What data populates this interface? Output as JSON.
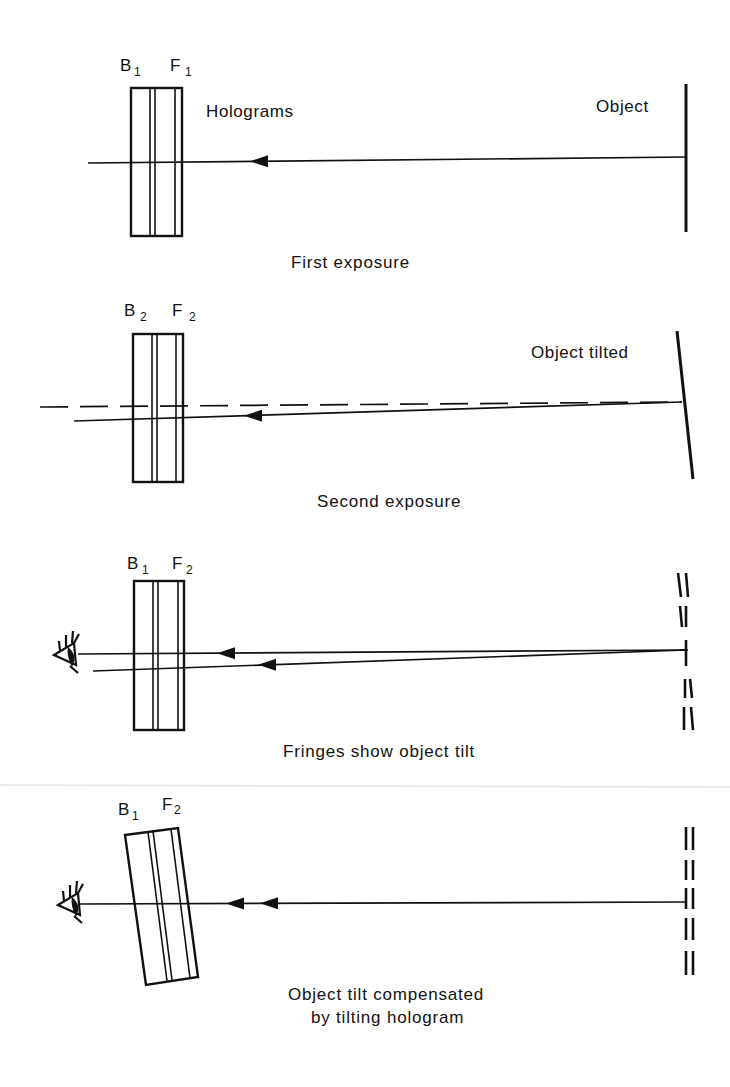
{
  "figure": {
    "panels": [
      {
        "id": "first-exposure",
        "plate_labels": {
          "back": "B",
          "back_sub": "1",
          "front": "F",
          "front_sub": "1"
        },
        "annotation": "Holograms",
        "object_label": "Object",
        "caption": "First exposure"
      },
      {
        "id": "second-exposure",
        "plate_labels": {
          "back": "B",
          "back_sub": "2",
          "front": "F",
          "front_sub": "2"
        },
        "object_label": "Object tilted",
        "caption": "Second exposure"
      },
      {
        "id": "fringes",
        "plate_labels": {
          "back": "B",
          "back_sub": "1",
          "front": "F",
          "front_sub": "2"
        },
        "caption": "Fringes  show object tilt"
      },
      {
        "id": "compensated",
        "plate_labels": {
          "back": "B",
          "back_sub": "1",
          "front": "F",
          "front_sub": "2"
        },
        "caption_line1": "Object tilt compensated",
        "caption_line2": "by tilting hologram"
      }
    ],
    "icons": [
      "eye-icon",
      "arrow-head-icon"
    ],
    "colors": {
      "ink": "#111111",
      "background": "#ffffff",
      "divider": "#e6e6e6"
    }
  }
}
